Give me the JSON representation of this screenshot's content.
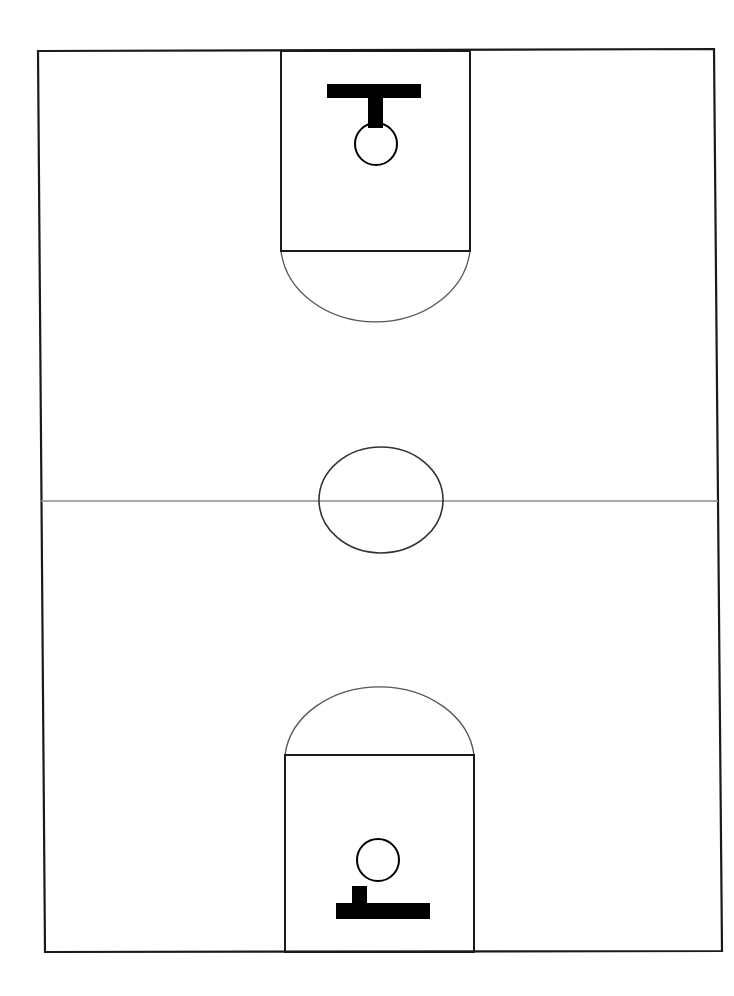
{
  "diagram": {
    "type": "full-court-schematic",
    "orientation": "vertical",
    "canvas": {
      "width": 734,
      "height": 996
    },
    "background_color": "#ffffff"
  },
  "colors": {
    "boundary_line": "#1a1a1a",
    "key_line": "#1a1a1a",
    "arc_line": "#555555",
    "circle_line": "#333333",
    "midcourt_line": "#8c8c8c",
    "basket_fill": "#000000",
    "hoop_stroke": "#000000",
    "court_surface": "#ffffff"
  },
  "court_boundary": {
    "label": "court-sideline-baseline-boundary",
    "points": "38,51 714,49 722,951 45,952",
    "stroke_width": 2.2
  },
  "midcourt_line": {
    "label": "midcourt-division-line",
    "x1": 41,
    "y1": 501,
    "x2": 718,
    "y2": 501,
    "stroke_width": 1.6
  },
  "center_circle": {
    "label": "center-jump-circle",
    "cx": 381,
    "cy": 500,
    "rx": 62,
    "ry": 53,
    "stroke_width": 1.6
  },
  "top_half": {
    "key": {
      "label": "top-free-throw-lane",
      "points": "281,51 470,51 470,251 281,251",
      "stroke_width": 2.0
    },
    "free_throw_line": {
      "x1": 281,
      "y1": 251,
      "x2": 470,
      "y2": 251,
      "stroke_width": 2.0
    },
    "free_throw_arc": {
      "label": "top-free-throw-semicircle",
      "path": "M 281,251 A 95,79 0 0 0 470,251",
      "stroke_width": 1.3
    },
    "backboard": {
      "label": "top-backboard",
      "x": 327,
      "y": 84,
      "width": 94,
      "height": 14
    },
    "stem": {
      "label": "top-basket-stem",
      "x": 368,
      "y": 97,
      "width": 15,
      "height": 31
    },
    "hoop": {
      "label": "top-hoop-rim",
      "cx": 376,
      "cy": 144,
      "r": 21,
      "stroke_width": 2.0
    }
  },
  "bottom_half": {
    "key": {
      "label": "bottom-free-throw-lane",
      "points": "285,755 474,755 474,952 285,952",
      "stroke_width": 2.0
    },
    "free_throw_line": {
      "x1": 285,
      "y1": 755,
      "x2": 474,
      "y2": 755,
      "stroke_width": 2.0
    },
    "free_throw_arc": {
      "label": "bottom-free-throw-semicircle",
      "path": "M 285,755 A 95,76 0 0 1 474,755",
      "stroke_width": 1.3
    },
    "backboard": {
      "label": "bottom-backboard",
      "x": 336,
      "y": 903,
      "width": 94,
      "height": 16
    },
    "stem": {
      "label": "bottom-basket-stem",
      "x": 352,
      "y": 886,
      "width": 15,
      "height": 19
    },
    "hoop": {
      "label": "bottom-hoop-rim",
      "cx": 378,
      "cy": 860,
      "r": 21,
      "stroke_width": 2.0
    }
  }
}
